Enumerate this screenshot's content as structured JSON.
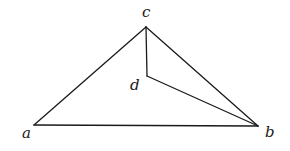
{
  "diagram": {
    "type": "geometric-figure",
    "vertices": [
      {
        "id": "a",
        "label": "a",
        "x": 34,
        "y": 125,
        "label_x": 22,
        "label_y": 138
      },
      {
        "id": "b",
        "label": "b",
        "x": 258,
        "y": 126,
        "label_x": 265,
        "label_y": 137
      },
      {
        "id": "c",
        "label": "c",
        "x": 146,
        "y": 27,
        "label_x": 142,
        "label_y": 17
      },
      {
        "id": "d",
        "label": "d",
        "x": 147,
        "y": 76,
        "label_x": 130,
        "label_y": 90
      }
    ],
    "edges": [
      {
        "from": "a",
        "to": "c"
      },
      {
        "from": "c",
        "to": "b"
      },
      {
        "from": "a",
        "to": "b"
      },
      {
        "from": "c",
        "to": "d"
      },
      {
        "from": "d",
        "to": "b"
      }
    ],
    "stroke_color": "#1a1a1a",
    "background_color": "#ffffff"
  }
}
